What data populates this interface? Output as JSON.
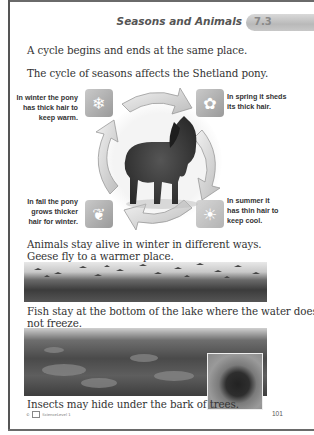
{
  "header": {
    "title": "Seasons and Animals",
    "lesson_number": "7.3"
  },
  "paragraphs": {
    "cycle_intro": "A cycle begins and ends at the same place.",
    "pony_intro": "The cycle of seasons affects the Shetland pony.",
    "animals_intro_line1": "Animals stay alive in winter in different ways.",
    "geese_line": "Geese fly to a warmer place.",
    "fish_line1": "Fish stay at the bottom of the lake where the water does",
    "fish_line2": "not freeze.",
    "insects_line": "Insects may hide under the bark of trees."
  },
  "seasons_cycle": {
    "winter": {
      "icon": "snowflake-icon",
      "glyph": "❄",
      "label_lines": [
        "In winter the pony",
        "has thick hair to",
        "keep warm."
      ]
    },
    "spring": {
      "icon": "flower-icon",
      "glyph": "✿",
      "label_lines": [
        "In spring it sheds",
        "its thick hair."
      ]
    },
    "summer": {
      "icon": "sun-icon",
      "glyph": "☀",
      "label_lines": [
        "In summer it",
        "has thin hair to",
        "keep cool."
      ]
    },
    "fall": {
      "icon": "leaf-icon",
      "glyph": "❦",
      "label_lines": [
        "In fall the pony",
        "grows thicker",
        "hair for winter."
      ]
    }
  },
  "footer": {
    "copyright": "©",
    "publisher": "ScienceLevel 1",
    "page_number": "101"
  },
  "colors": {
    "badge": "#c4c4c4",
    "title_text": "#555555",
    "body_text": "#333333",
    "icon_tile": "#a8a8a8"
  }
}
